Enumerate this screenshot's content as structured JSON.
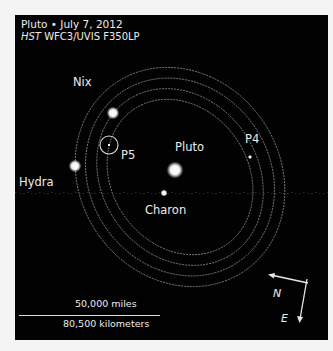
{
  "caption": {
    "line1": "Pluto • July 7, 2012",
    "line2_instrument_italic": "HST",
    "line2_rest": " WFC3/UVIS F350LP"
  },
  "bodies": [
    {
      "name": "Pluto",
      "label": "Pluto",
      "x": 160,
      "y": 155,
      "r": 6,
      "label_x": 160,
      "label_y": 125
    },
    {
      "name": "Charon",
      "label": "Charon",
      "x": 149,
      "y": 178,
      "r": 2.5,
      "label_x": 130,
      "label_y": 188
    },
    {
      "name": "Nix",
      "label": "Nix",
      "x": 98,
      "y": 98,
      "r": 4.5,
      "label_x": 58,
      "label_y": 60
    },
    {
      "name": "Hydra",
      "label": "Hydra",
      "x": 60,
      "y": 151,
      "r": 4.5,
      "label_x": 4,
      "label_y": 160
    },
    {
      "name": "P4",
      "label": "P4",
      "x": 235,
      "y": 142,
      "r": 1.5,
      "label_x": 230,
      "label_y": 117
    },
    {
      "name": "P5",
      "label": "P5",
      "x": 94,
      "y": 130,
      "r": 1,
      "label_x": 106,
      "label_y": 133
    }
  ],
  "p5_marker": {
    "cx": 94,
    "cy": 130,
    "r": 9
  },
  "orbits": {
    "center_x": 165,
    "center_y": 162,
    "rotation_deg": 35,
    "rings": [
      {
        "rx": 68,
        "ry": 82
      },
      {
        "rx": 78,
        "ry": 93
      },
      {
        "rx": 90,
        "ry": 103
      },
      {
        "rx": 100,
        "ry": 114
      }
    ]
  },
  "scale_bar": {
    "top_label": "50,000 miles",
    "bottom_label": "80,500 kilometers"
  },
  "compass": {
    "north": "N",
    "east": "E"
  },
  "colors": {
    "background": "#020202",
    "text": "#ececec",
    "orbit": "#8a8a8a",
    "frame": "#f4f4f4"
  }
}
